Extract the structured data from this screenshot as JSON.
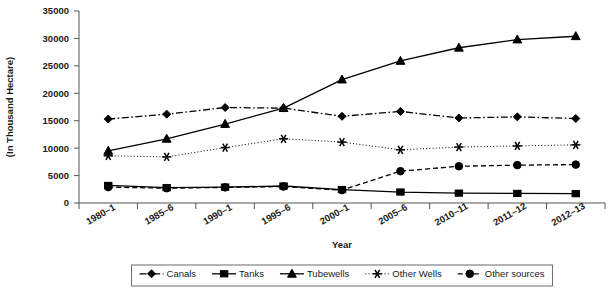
{
  "chart_data": {
    "type": "line",
    "title": "",
    "xlabel": "Year",
    "ylabel": "(In Thousand Hectare)",
    "categories": [
      "1980–1",
      "1985–6",
      "1990–1",
      "1995–6",
      "2000–1",
      "2005–6",
      "2010–11",
      "2011–12",
      "2012–13"
    ],
    "ylim": [
      0,
      35000
    ],
    "ytick_values": [
      0,
      5000,
      10000,
      15000,
      20000,
      25000,
      30000,
      35000
    ],
    "ytick_labels": [
      "0",
      "5000",
      "10000",
      "15000",
      "20000",
      "25000",
      "30000",
      "35000"
    ],
    "grid": false,
    "legend_position": "bottom",
    "series": [
      {
        "name": "Canals",
        "marker": "diamond",
        "dash": "dash-dot",
        "color": "#000000",
        "values": [
          15300,
          16200,
          17400,
          17300,
          15800,
          16700,
          15500,
          15700,
          15400
        ]
      },
      {
        "name": "Tanks",
        "marker": "square",
        "dash": "solid",
        "color": "#000000",
        "values": [
          3200,
          2800,
          2900,
          3100,
          2450,
          2000,
          1800,
          1750,
          1700
        ]
      },
      {
        "name": "Tubewells",
        "marker": "triangle",
        "dash": "solid",
        "color": "#000000",
        "values": [
          9500,
          11700,
          14400,
          17300,
          22500,
          25900,
          28300,
          29800,
          30400
        ]
      },
      {
        "name": "Other Wells",
        "marker": "asterisk",
        "dash": "dotted",
        "color": "#000000",
        "values": [
          8600,
          8400,
          10100,
          11700,
          11100,
          9700,
          10200,
          10400,
          10600
        ]
      },
      {
        "name": "Other sources",
        "marker": "circle",
        "dash": "dashed",
        "color": "#000000",
        "values": [
          2900,
          2700,
          2850,
          3000,
          2350,
          5800,
          6700,
          6900,
          7000
        ]
      }
    ]
  },
  "legend": {
    "items": [
      {
        "label": "Canals",
        "marker": "diamond-icon"
      },
      {
        "label": "Tanks",
        "marker": "square-icon"
      },
      {
        "label": "Tubewells",
        "marker": "triangle-icon"
      },
      {
        "label": "Other Wells",
        "marker": "asterisk-icon"
      },
      {
        "label": "Other sources",
        "marker": "circle-icon"
      }
    ]
  }
}
